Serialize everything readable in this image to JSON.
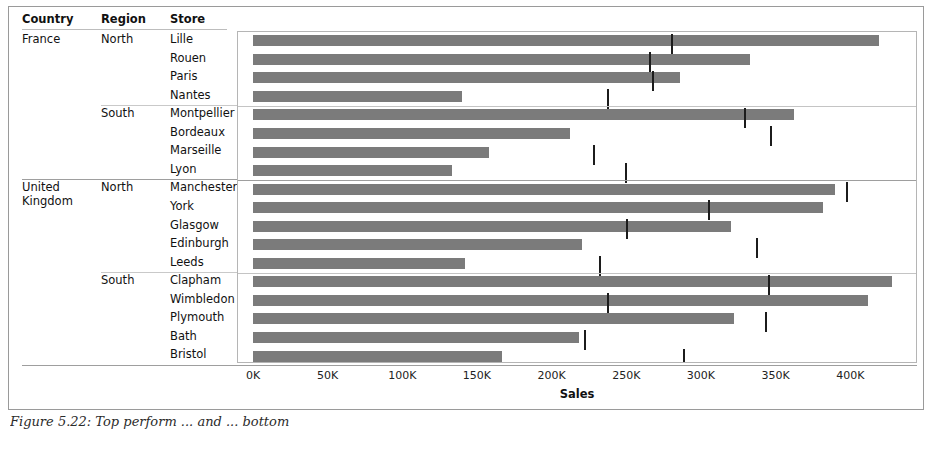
{
  "figure": {
    "caption": "Figure 5.22: Top perform ... and ... bottom"
  },
  "table": {
    "headers": {
      "country": "Country",
      "region": "Region",
      "store": "Store"
    },
    "rows": [
      {
        "country": "France",
        "region": "North",
        "store": "Lille",
        "sales": 419,
        "target": 280,
        "country_start": true,
        "region_start": true
      },
      {
        "country": "",
        "region": "",
        "store": "Rouen",
        "sales": 333,
        "target": 265,
        "country_start": false,
        "region_start": false
      },
      {
        "country": "",
        "region": "",
        "store": "Paris",
        "sales": 286,
        "target": 267,
        "country_start": false,
        "region_start": false
      },
      {
        "country": "",
        "region": "",
        "store": "Nantes",
        "sales": 140,
        "target": 237,
        "country_start": false,
        "region_start": false
      },
      {
        "country": "",
        "region": "South",
        "store": "Montpellier",
        "sales": 362,
        "target": 329,
        "country_start": false,
        "region_start": true
      },
      {
        "country": "",
        "region": "",
        "store": "Bordeaux",
        "sales": 212,
        "target": 346,
        "country_start": false,
        "region_start": false
      },
      {
        "country": "",
        "region": "",
        "store": "Marseille",
        "sales": 158,
        "target": 228,
        "country_start": false,
        "region_start": false
      },
      {
        "country": "",
        "region": "",
        "store": "Lyon",
        "sales": 133,
        "target": 249,
        "country_start": false,
        "region_start": false
      },
      {
        "country": "United Kingdom",
        "region": "North",
        "store": "Manchester",
        "sales": 390,
        "target": 397,
        "country_start": true,
        "region_start": true
      },
      {
        "country": "",
        "region": "",
        "store": "York",
        "sales": 382,
        "target": 305,
        "country_start": false,
        "region_start": false
      },
      {
        "country": "",
        "region": "",
        "store": "Glasgow",
        "sales": 320,
        "target": 250,
        "country_start": false,
        "region_start": false
      },
      {
        "country": "",
        "region": "",
        "store": "Edinburgh",
        "sales": 220,
        "target": 337,
        "country_start": false,
        "region_start": false
      },
      {
        "country": "",
        "region": "",
        "store": "Leeds",
        "sales": 142,
        "target": 232,
        "country_start": false,
        "region_start": false
      },
      {
        "country": "",
        "region": "South",
        "store": "Clapham",
        "sales": 428,
        "target": 345,
        "country_start": false,
        "region_start": true
      },
      {
        "country": "",
        "region": "",
        "store": "Wimbledon",
        "sales": 412,
        "target": 237,
        "country_start": false,
        "region_start": false
      },
      {
        "country": "",
        "region": "",
        "store": "Plymouth",
        "sales": 322,
        "target": 343,
        "country_start": false,
        "region_start": false
      },
      {
        "country": "",
        "region": "",
        "store": "Bath",
        "sales": 218,
        "target": 222,
        "country_start": false,
        "region_start": false
      },
      {
        "country": "",
        "region": "",
        "store": "Bristol",
        "sales": 167,
        "target": 288,
        "country_start": false,
        "region_start": false
      }
    ]
  },
  "chart_data": {
    "type": "bar",
    "orientation": "horizontal",
    "title": "",
    "xlabel": "Sales",
    "ylabel": "",
    "xlim": [
      0,
      440
    ],
    "xticks": [
      0,
      50,
      100,
      150,
      200,
      250,
      300,
      350,
      400
    ],
    "xticklabels": [
      "0K",
      "50K",
      "100K",
      "150K",
      "200K",
      "250K",
      "300K",
      "350K",
      "400K"
    ],
    "grid": false,
    "bar_color": "#7b7b7b",
    "reference_line_color": "#1c1c1c",
    "units": "thousands",
    "categories": [
      "Lille",
      "Rouen",
      "Paris",
      "Nantes",
      "Montpellier",
      "Bordeaux",
      "Marseille",
      "Lyon",
      "Manchester",
      "York",
      "Glasgow",
      "Edinburgh",
      "Leeds",
      "Clapham",
      "Wimbledon",
      "Plymouth",
      "Bath",
      "Bristol"
    ],
    "series": [
      {
        "name": "Sales",
        "mark": "bar",
        "values": [
          419,
          333,
          286,
          140,
          362,
          212,
          158,
          133,
          390,
          382,
          320,
          220,
          142,
          428,
          412,
          322,
          218,
          167
        ]
      },
      {
        "name": "Target",
        "mark": "reference-line",
        "values": [
          280,
          265,
          267,
          237,
          329,
          346,
          228,
          249,
          397,
          305,
          250,
          337,
          232,
          345,
          237,
          343,
          222,
          288
        ]
      }
    ],
    "groups": [
      {
        "country": "France",
        "regions": [
          {
            "region": "North",
            "stores": [
              "Lille",
              "Rouen",
              "Paris",
              "Nantes"
            ]
          },
          {
            "region": "South",
            "stores": [
              "Montpellier",
              "Bordeaux",
              "Marseille",
              "Lyon"
            ]
          }
        ]
      },
      {
        "country": "United Kingdom",
        "regions": [
          {
            "region": "North",
            "stores": [
              "Manchester",
              "York",
              "Glasgow",
              "Edinburgh",
              "Leeds"
            ]
          },
          {
            "region": "South",
            "stores": [
              "Clapham",
              "Wimbledon",
              "Plymouth",
              "Bath",
              "Bristol"
            ]
          }
        ]
      }
    ]
  }
}
